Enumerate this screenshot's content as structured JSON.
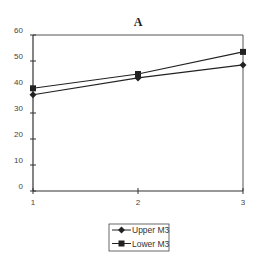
{
  "chart_data": {
    "type": "line",
    "title": "A",
    "xlabel": "",
    "ylabel": "",
    "x": [
      1,
      2,
      3
    ],
    "categories": [
      "1",
      "2",
      "3"
    ],
    "series": [
      {
        "name": "Upper M3",
        "marker": "diamond",
        "values": [
          37,
          43.5,
          48.5
        ]
      },
      {
        "name": "Lower M3",
        "marker": "square",
        "values": [
          39.5,
          45,
          53.5
        ]
      }
    ],
    "ylim": [
      0,
      60
    ],
    "yticks": [
      0,
      10,
      20,
      30,
      40,
      50,
      60
    ],
    "xticks": [
      1,
      2,
      3
    ],
    "grid": false,
    "legend_position": "bottom-center",
    "colors": {
      "line": "#222222",
      "axis": "#333333",
      "frame": "#555555"
    }
  }
}
